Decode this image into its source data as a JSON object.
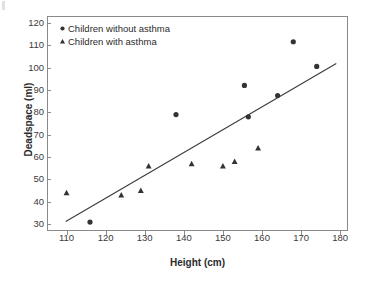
{
  "chart_data": {
    "type": "scatter",
    "title": "",
    "xlabel": "Height (cm)",
    "ylabel": "Deadspace (ml)",
    "xlim": [
      105,
      182
    ],
    "ylim": [
      27,
      123
    ],
    "xticks": [
      110,
      120,
      130,
      140,
      150,
      160,
      170,
      180
    ],
    "yticks": [
      30,
      40,
      50,
      60,
      70,
      80,
      90,
      100,
      110,
      120
    ],
    "grid": false,
    "legend_position": "top-left",
    "marker_color": "#333333",
    "line_color": "#3b3b3b",
    "frame_color": "#8a8a8a",
    "series": [
      {
        "name": "Children without asthma",
        "marker": "circle",
        "points": [
          {
            "x": 116.0,
            "y": 31.0
          },
          {
            "x": 138.0,
            "y": 79.0
          },
          {
            "x": 155.5,
            "y": 92.0
          },
          {
            "x": 156.5,
            "y": 78.0
          },
          {
            "x": 164.0,
            "y": 87.5
          },
          {
            "x": 168.0,
            "y": 111.5
          },
          {
            "x": 174.0,
            "y": 100.5
          }
        ]
      },
      {
        "name": "Children with asthma",
        "marker": "triangle",
        "points": [
          {
            "x": 110.0,
            "y": 44.0
          },
          {
            "x": 124.0,
            "y": 43.0
          },
          {
            "x": 129.0,
            "y": 45.0
          },
          {
            "x": 131.0,
            "y": 56.0
          },
          {
            "x": 142.0,
            "y": 57.0
          },
          {
            "x": 150.0,
            "y": 56.0
          },
          {
            "x": 153.0,
            "y": 58.0
          },
          {
            "x": 159.0,
            "y": 64.0
          }
        ]
      }
    ],
    "regression_line": {
      "name": "fitted regression line",
      "x_start": 109.8,
      "y_start": 31.2,
      "x_end": 179.0,
      "y_end": 101.8
    }
  },
  "legend": {
    "items": [
      {
        "label": "Children without asthma",
        "marker": "circle"
      },
      {
        "label": "Children with asthma",
        "marker": "triangle"
      }
    ]
  }
}
